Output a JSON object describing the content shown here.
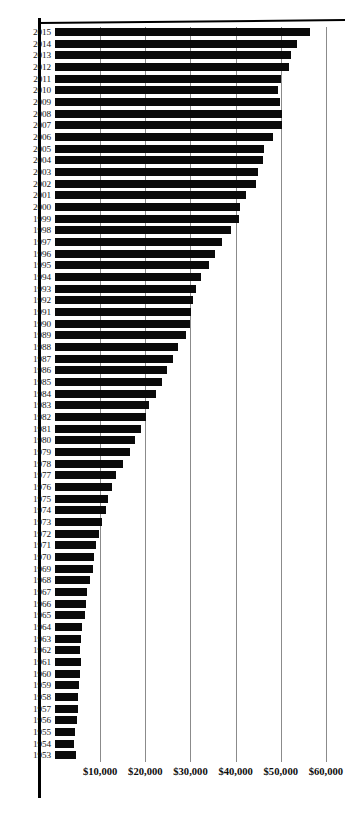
{
  "chart": {
    "type": "bar",
    "orientation": "horizontal",
    "title": "",
    "subtitle": "",
    "xlabel": "",
    "ylabel": "",
    "grid": true,
    "legend": null,
    "axis_style": "vertical gridlines only, no visible axis box"
  },
  "chart_data": {
    "type": "bar",
    "orientation": "horizontal",
    "title": "",
    "xlabel": "",
    "ylabel": "",
    "xlim": [
      0,
      64000
    ],
    "ylim": null,
    "grid": true,
    "legend_position": "none",
    "x_tick_labels": [
      "$10,000",
      "$20,000",
      "$30,000",
      "$40,000",
      "$50,000",
      "$60,000"
    ],
    "x_tick_values": [
      10000,
      20000,
      30000,
      40000,
      50000,
      60000
    ],
    "categories": [
      "2015",
      "2014",
      "2013",
      "2012",
      "2011",
      "2010",
      "2009",
      "2008",
      "2007",
      "2006",
      "2005",
      "2004",
      "2003",
      "2002",
      "2001",
      "2000",
      "1999",
      "1998",
      "1997",
      "1996",
      "1995",
      "1994",
      "1993",
      "1992",
      "1991",
      "1990",
      "1989",
      "1988",
      "1987",
      "1986",
      "1985",
      "1984",
      "1983",
      "1982",
      "1981",
      "1980",
      "1979",
      "1978",
      "1977",
      "1976",
      "1975",
      "1974",
      "1973",
      "1972",
      "1971",
      "1970",
      "1969",
      "1968",
      "1967",
      "1966",
      "1965",
      "1964",
      "1963",
      "1962",
      "1961",
      "1960",
      "1959",
      "1958",
      "1957",
      "1956",
      "1955",
      "1954",
      "1953"
    ],
    "values": [
      56500,
      53700,
      52200,
      51800,
      50100,
      49300,
      49800,
      50300,
      50200,
      48200,
      46300,
      46000,
      45000,
      44500,
      42200,
      41000,
      40800,
      38900,
      37000,
      35500,
      34100,
      32300,
      31200,
      30600,
      30100,
      29900,
      28900,
      27200,
      26100,
      24900,
      23600,
      22400,
      20900,
      20200,
      19100,
      17700,
      16500,
      15100,
      13600,
      12700,
      11800,
      11200,
      10500,
      9700,
      9000,
      8700,
      8400,
      7700,
      7100,
      6900,
      6600,
      6000,
      5800,
      5500,
      5700,
      5600,
      5400,
      5100,
      5000,
      4800,
      4400,
      4200,
      4700
    ],
    "bar_color": "#0a0a0a",
    "gridline_color": "#8b8b8b",
    "value_unit": "US dollars"
  }
}
